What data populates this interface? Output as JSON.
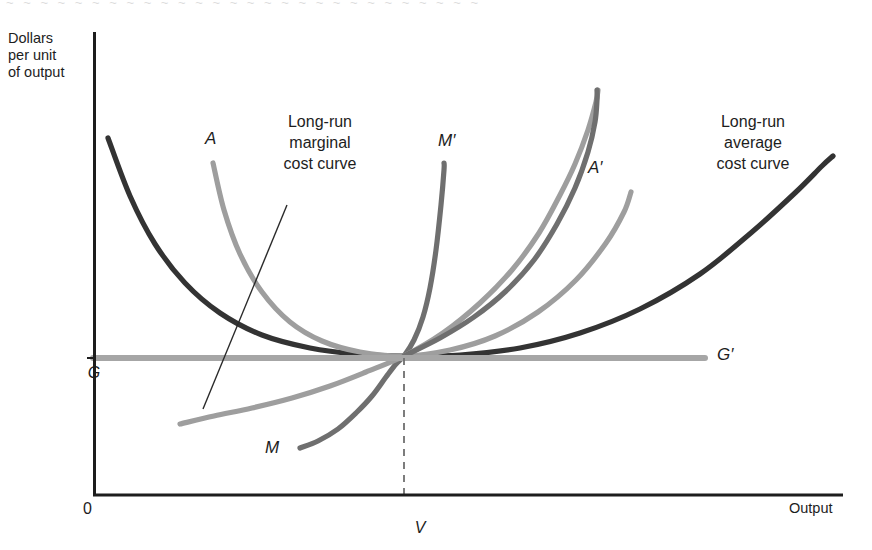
{
  "figure": {
    "y_axis_title": "Dollars\nper unit\nof output",
    "x_axis_title": "Output",
    "origin_label": "0",
    "y_tick_label": "G",
    "x_tick_label": "V",
    "g_prime_label": "G′",
    "curve_labels": {
      "a": "A",
      "a_prime": "A′",
      "m": "M",
      "m_prime": "M′"
    },
    "annotations": {
      "marginal": "Long-run\nmarginal\ncost curve",
      "average": "Long-run\naverage\ncost curve"
    },
    "colors": {
      "axis": "#1d1d1d",
      "lrac": "#333333",
      "short_run_average": "#9e9e9e",
      "short_run_marginal": "#6f6f6f",
      "price_line": "#a6a6a6",
      "dashed_guide": "#6f6f6f",
      "leader_line": "#2a2a2a",
      "background": "#ffffff"
    }
  },
  "chart_data": {
    "type": "line",
    "xlabel": "Output",
    "ylabel": "Dollars per unit of output",
    "grid": false,
    "legend": "inline-labels",
    "axis_pixel_frame": {
      "x0": 93,
      "x1": 843,
      "y_top": 32,
      "y_bottom": 496
    },
    "tangency_point": {
      "x_label": "V",
      "y_label": "G",
      "px": 404,
      "py": 356
    },
    "xticks": [
      "0",
      "V"
    ],
    "yticks": [
      "G"
    ],
    "series": [
      {
        "name": "Long-run average cost curve",
        "key": "lrac",
        "color": "#333333",
        "width": 5.2,
        "points": [
          [
            108,
            138
          ],
          [
            130,
            196
          ],
          [
            155,
            244
          ],
          [
            185,
            283
          ],
          [
            220,
            313
          ],
          [
            262,
            335
          ],
          [
            310,
            348
          ],
          [
            356,
            354
          ],
          [
            404,
            356
          ],
          [
            460,
            355
          ],
          [
            520,
            348
          ],
          [
            580,
            333
          ],
          [
            640,
            309
          ],
          [
            700,
            274
          ],
          [
            752,
            232
          ],
          [
            796,
            192
          ],
          [
            822,
            166
          ],
          [
            833,
            156
          ]
        ]
      },
      {
        "name": "Short-run average cost curve A",
        "key": "A",
        "color": "#9e9e9e",
        "width": 5.2,
        "points": [
          [
            213,
            163
          ],
          [
            224,
            210
          ],
          [
            240,
            254
          ],
          [
            262,
            292
          ],
          [
            290,
            322
          ],
          [
            322,
            341
          ],
          [
            360,
            352
          ],
          [
            404,
            356
          ],
          [
            450,
            350
          ],
          [
            495,
            336
          ],
          [
            538,
            312
          ],
          [
            576,
            280
          ],
          [
            606,
            243
          ],
          [
            624,
            212
          ],
          [
            631,
            192
          ]
        ]
      },
      {
        "name": "Short-run marginal cost curve M",
        "key": "M",
        "color": "#6f6f6f",
        "width": 5.2,
        "points": [
          [
            300,
            448
          ],
          [
            318,
            441
          ],
          [
            338,
            429
          ],
          [
            356,
            413
          ],
          [
            372,
            396
          ],
          [
            386,
            377
          ],
          [
            396,
            364
          ],
          [
            404,
            356
          ],
          [
            414,
            340
          ],
          [
            423,
            317
          ],
          [
            430,
            288
          ],
          [
            436,
            250
          ],
          [
            441,
            205
          ],
          [
            444,
            170
          ],
          [
            444,
            163
          ]
        ]
      },
      {
        "name": "Short-run average cost curve A-prime",
        "key": "Aprime",
        "color": "#9e9e9e",
        "width": 5.2,
        "points": [
          [
            180,
            424
          ],
          [
            214,
            416
          ],
          [
            252,
            408
          ],
          [
            292,
            398
          ],
          [
            330,
            386
          ],
          [
            366,
            372
          ],
          [
            404,
            356
          ],
          [
            443,
            333
          ],
          [
            480,
            303
          ],
          [
            512,
            270
          ],
          [
            539,
            233
          ],
          [
            560,
            195
          ],
          [
            575,
            164
          ],
          [
            588,
            130
          ],
          [
            596,
            102
          ],
          [
            598,
            90
          ]
        ]
      },
      {
        "name": "Short-run marginal cost curve M-prime",
        "key": "Mprime",
        "color": "#6f6f6f",
        "width": 5.2,
        "points": [
          [
            404,
            356
          ],
          [
            440,
            338
          ],
          [
            474,
            317
          ],
          [
            506,
            291
          ],
          [
            534,
            260
          ],
          [
            557,
            224
          ],
          [
            575,
            188
          ],
          [
            588,
            152
          ],
          [
            595,
            122
          ],
          [
            597,
            100
          ],
          [
            597,
            90
          ]
        ]
      },
      {
        "name": "Price line G G-prime",
        "key": "G",
        "color": "#a6a6a6",
        "width": 6.0,
        "points": [
          [
            93,
            358
          ],
          [
            705,
            358
          ]
        ]
      }
    ]
  }
}
